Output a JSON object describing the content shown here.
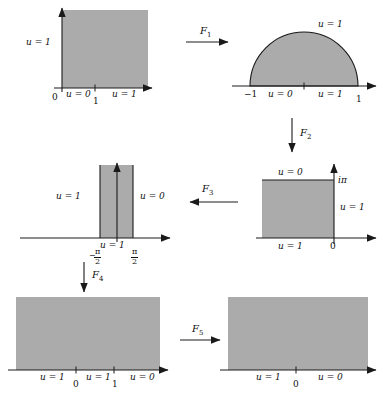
{
  "figure": {
    "type": "conformal-mapping-diagram",
    "fill_color": "#ababab",
    "stroke_color": "#1a1a1a"
  },
  "panels": [
    {
      "id": "panel-1",
      "name": "unit-square-quadrant",
      "shape": "rectangle",
      "labels": {
        "left": "u = 1",
        "bottom_left_tick": "0",
        "bottom_mid": "u = 0",
        "bottom_tick": "1",
        "bottom_right": "u = 1"
      }
    },
    {
      "id": "panel-2",
      "name": "upper-half-disk",
      "shape": "semicircle",
      "labels": {
        "arc": "u = 1",
        "axis_left_tick": "−1",
        "axis_mid": "u = 0",
        "axis_right": "u = 1",
        "axis_right_tick": "1"
      }
    },
    {
      "id": "panel-3",
      "name": "half-strip-log",
      "shape": "rectangle",
      "labels": {
        "top": "u = 0",
        "top_right_tick": "iπ",
        "right": "u = 1",
        "bottom": "u = 1",
        "origin": "0"
      }
    },
    {
      "id": "panel-4",
      "name": "vertical-strip",
      "shape": "strip",
      "labels": {
        "left": "u = 1",
        "right": "u = 0",
        "bottom": "u = 1",
        "left_tick_num": "π",
        "left_tick_den": "2",
        "left_tick_sign": "−",
        "right_tick_num": "π",
        "right_tick_den": "2"
      }
    },
    {
      "id": "panel-5",
      "name": "upper-half-plane-three-segments",
      "shape": "rectangle",
      "labels": {
        "left": "u = 1",
        "tick_zero": "0",
        "mid": "u = 1",
        "tick_one": "1",
        "right": "u = 0"
      }
    },
    {
      "id": "panel-6",
      "name": "upper-half-plane-two-segments",
      "shape": "rectangle",
      "labels": {
        "left": "u = 1",
        "tick_zero": "0",
        "right": "u = 0"
      }
    }
  ],
  "maps": [
    {
      "id": "map-f1",
      "label": "F",
      "index": "1",
      "direction": "right"
    },
    {
      "id": "map-f2",
      "label": "F",
      "index": "2",
      "direction": "down"
    },
    {
      "id": "map-f3",
      "label": "F",
      "index": "3",
      "direction": "left"
    },
    {
      "id": "map-f4",
      "label": "F",
      "index": "4",
      "direction": "down"
    },
    {
      "id": "map-f5",
      "label": "F",
      "index": "5",
      "direction": "right"
    }
  ]
}
